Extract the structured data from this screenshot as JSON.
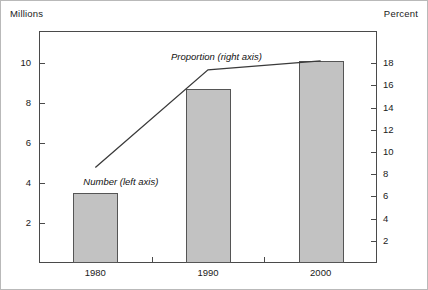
{
  "chart_data": {
    "type": "bar",
    "title": "",
    "xlabel": "",
    "categories": [
      "1980",
      "1990",
      "2000"
    ],
    "grid": false,
    "legend_position": "inline-annotation",
    "series": [
      {
        "name": "Number (left axis)",
        "type": "bar",
        "axis": "left",
        "unit": "Millions",
        "values": [
          3.5,
          8.7,
          10.1
        ],
        "fill_color": "#c2c2c2",
        "edge_color": "#555555"
      },
      {
        "name": "Proportion (right axis)",
        "type": "line",
        "axis": "right",
        "unit": "Percent",
        "values": [
          8.6,
          17.4,
          18.2
        ],
        "line_color": "#3a3a3a"
      }
    ],
    "left_axis": {
      "label": "Millions",
      "ticks": [
        2,
        4,
        6,
        8,
        10
      ],
      "tick_labels": [
        "2",
        "4",
        "6",
        "8",
        "10"
      ],
      "ylim": [
        0,
        11.6
      ]
    },
    "right_axis": {
      "label": "Percent",
      "ticks": [
        2,
        4,
        6,
        8,
        10,
        12,
        14,
        16,
        18
      ],
      "tick_labels": [
        "2",
        "4",
        "6",
        "8",
        "10",
        "12",
        "14",
        "16",
        "18"
      ],
      "ylim": [
        0,
        20.9
      ]
    },
    "annotations": [
      {
        "text": "Number (left axis)",
        "style": "italic"
      },
      {
        "text": "Proportion (right axis)",
        "style": "italic"
      }
    ]
  },
  "labels": {
    "unit_left": "Millions",
    "unit_right": "Percent",
    "series_bar": "Number (left axis)",
    "series_line": "Proportion (right axis)"
  }
}
